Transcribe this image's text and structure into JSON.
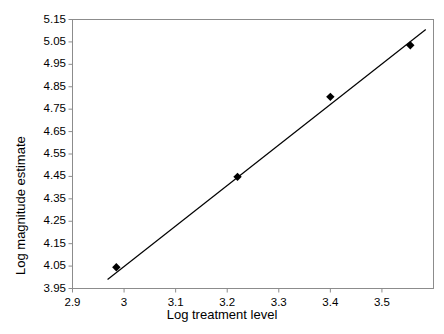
{
  "chart_data": {
    "type": "scatter",
    "title": "",
    "xlabel": "Log treatment level",
    "ylabel": "Log magnitude estimate",
    "xlim": [
      2.9,
      3.6
    ],
    "ylim": [
      3.95,
      5.15
    ],
    "grid": false,
    "legend": null,
    "x_ticks": [
      "2.9",
      "3",
      "3.1",
      "3.2",
      "3.3",
      "3.4",
      "3.5"
    ],
    "x_tick_values": [
      2.9,
      3.0,
      3.1,
      3.2,
      3.3,
      3.4,
      3.5
    ],
    "y_ticks": [
      "3.95",
      "4.05",
      "4.15",
      "4.25",
      "4.35",
      "4.45",
      "4.55",
      "4.65",
      "4.75",
      "4.85",
      "4.95",
      "5.05",
      "5.15"
    ],
    "y_tick_values": [
      3.95,
      4.05,
      4.15,
      4.25,
      4.35,
      4.45,
      4.55,
      4.65,
      4.75,
      4.85,
      4.95,
      5.05,
      5.15
    ],
    "series": [
      {
        "name": "observations",
        "marker": "diamond",
        "color": "#000000",
        "points": [
          {
            "x": 2.985,
            "y": 4.045
          },
          {
            "x": 3.22,
            "y": 4.448
          },
          {
            "x": 3.4,
            "y": 4.805
          },
          {
            "x": 3.555,
            "y": 5.035
          }
        ]
      },
      {
        "name": "fitted-line",
        "type": "line",
        "color": "#000000",
        "points": [
          {
            "x": 2.968,
            "y": 3.99
          },
          {
            "x": 3.585,
            "y": 5.105
          }
        ]
      }
    ]
  },
  "axes": {
    "frame_color": "#808080",
    "tick_color": "#808080"
  }
}
